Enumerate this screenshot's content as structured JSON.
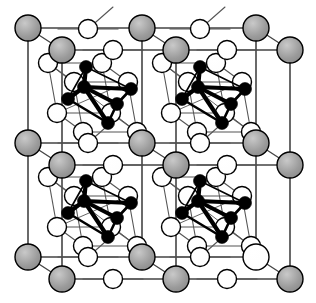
{
  "figure": {
    "kind": "crystal-structure-diagram",
    "title": "",
    "caption": "",
    "width": 316,
    "height": 303,
    "background": "#ffffff"
  },
  "style": {
    "gray_fill": "#9b9b9b",
    "white_fill": "#ffffff",
    "black_fill": "#000000",
    "outline": "#000000",
    "thin_bond": "#555555",
    "frame": "#444444",
    "large_radius": 13,
    "medium_radius": 9.5,
    "small_radius": 6.5,
    "cluster_radius": 6.5
  },
  "legend": {
    "gray_label": "large gray sphere",
    "white_label": "open white sphere",
    "black_label": "filled black sphere"
  },
  "lattice": {
    "cells_x": 2,
    "cells_y": 2,
    "cell_pitch_x": 114,
    "cell_pitch_y": 114,
    "origin_x": 28,
    "origin_y": 28,
    "depth_offset_x": 34,
    "depth_offset_y": 22
  },
  "chart_data": {
    "type": "scatter",
    "title": "",
    "xlabel": "",
    "ylabel": "",
    "grid": false,
    "legend_position": "none",
    "xlim": [
      0,
      316
    ],
    "ylim": [
      0,
      303
    ],
    "series": [
      {
        "name": "gray-front-lattice",
        "marker": "large-gray-circle",
        "color": "#9b9b9b",
        "points": [
          [
            28,
            28
          ],
          [
            142,
            28
          ],
          [
            256,
            28
          ],
          [
            28,
            143
          ],
          [
            142,
            143
          ],
          [
            256,
            143
          ],
          [
            28,
            257
          ],
          [
            142,
            257
          ]
        ]
      },
      {
        "name": "gray-back-lattice",
        "marker": "large-gray-circle",
        "color": "#9b9b9b",
        "points": [
          [
            62,
            50
          ],
          [
            176,
            50
          ],
          [
            290,
            50
          ],
          [
            62,
            165
          ],
          [
            176,
            165
          ],
          [
            290,
            165
          ],
          [
            62,
            279
          ],
          [
            176,
            279
          ],
          [
            290,
            279
          ]
        ]
      },
      {
        "name": "white-large-lattice",
        "marker": "large-white-circle",
        "color": "#ffffff",
        "points": [
          [
            256,
            257
          ]
        ]
      },
      {
        "name": "white-front-edges",
        "marker": "white-circle",
        "color": "#ffffff",
        "points": [
          [
            88,
            143
          ],
          [
            200,
            143
          ],
          [
            88,
            257
          ],
          [
            200,
            257
          ],
          [
            88,
            29
          ],
          [
            200,
            29
          ]
        ]
      },
      {
        "name": "white-back-edges",
        "marker": "white-circle",
        "color": "#ffffff",
        "points": [
          [
            113,
            50
          ],
          [
            227,
            50
          ],
          [
            113,
            165
          ],
          [
            227,
            165
          ],
          [
            113,
            279
          ],
          [
            227,
            279
          ]
        ]
      },
      {
        "name": "white-cube-cell-1",
        "marker": "white-circle",
        "color": "#ffffff",
        "points": [
          [
            48,
            63
          ],
          [
            102,
            63
          ],
          [
            74,
            82
          ],
          [
            128,
            82
          ],
          [
            57,
            113
          ],
          [
            111,
            113
          ],
          [
            83,
            132
          ],
          [
            137,
            132
          ]
        ]
      },
      {
        "name": "white-cube-cell-2",
        "marker": "white-circle",
        "color": "#ffffff",
        "points": [
          [
            162,
            63
          ],
          [
            216,
            63
          ],
          [
            188,
            82
          ],
          [
            242,
            82
          ],
          [
            171,
            113
          ],
          [
            225,
            113
          ],
          [
            197,
            132
          ],
          [
            251,
            132
          ]
        ]
      },
      {
        "name": "white-cube-cell-3",
        "marker": "white-circle",
        "color": "#ffffff",
        "points": [
          [
            48,
            177
          ],
          [
            102,
            177
          ],
          [
            74,
            196
          ],
          [
            128,
            196
          ],
          [
            57,
            227
          ],
          [
            111,
            227
          ],
          [
            83,
            246
          ],
          [
            137,
            246
          ]
        ]
      },
      {
        "name": "white-cube-cell-4",
        "marker": "white-circle",
        "color": "#ffffff",
        "points": [
          [
            162,
            177
          ],
          [
            216,
            177
          ],
          [
            188,
            196
          ],
          [
            242,
            196
          ],
          [
            171,
            227
          ],
          [
            225,
            227
          ],
          [
            197,
            246
          ],
          [
            251,
            246
          ]
        ]
      },
      {
        "name": "black-cluster-cell-1",
        "marker": "black-circle",
        "color": "#000000",
        "center": [
          84,
          87
        ],
        "points": [
          [
            84,
            87
          ],
          [
            86,
            67
          ],
          [
            68,
            99
          ],
          [
            117,
            104
          ],
          [
            108,
            123
          ],
          [
            131,
            89
          ]
        ]
      },
      {
        "name": "black-cluster-cell-2",
        "marker": "black-circle",
        "color": "#000000",
        "center": [
          198,
          87
        ],
        "points": [
          [
            198,
            87
          ],
          [
            200,
            67
          ],
          [
            182,
            99
          ],
          [
            231,
            104
          ],
          [
            222,
            123
          ],
          [
            245,
            89
          ]
        ]
      },
      {
        "name": "black-cluster-cell-3",
        "marker": "black-circle",
        "color": "#000000",
        "center": [
          84,
          201
        ],
        "points": [
          [
            84,
            201
          ],
          [
            86,
            181
          ],
          [
            68,
            213
          ],
          [
            117,
            218
          ],
          [
            108,
            237
          ],
          [
            131,
            203
          ]
        ]
      },
      {
        "name": "black-cluster-cell-4",
        "marker": "black-circle",
        "color": "#000000",
        "center": [
          198,
          201
        ],
        "points": [
          [
            198,
            201
          ],
          [
            200,
            181
          ],
          [
            182,
            213
          ],
          [
            231,
            218
          ],
          [
            222,
            237
          ],
          [
            245,
            203
          ]
        ]
      }
    ],
    "annotations": []
  }
}
